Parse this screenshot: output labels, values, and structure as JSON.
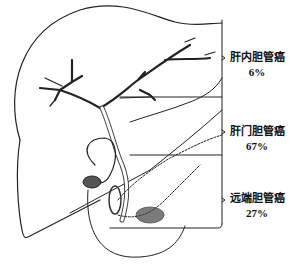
{
  "diagram": {
    "regions": [
      {
        "name": "肝内胆管癌",
        "percent": "6%"
      },
      {
        "name": "肝门胆管癌",
        "percent": "67%"
      },
      {
        "name": "远端胆管癌",
        "percent": "27%"
      }
    ]
  }
}
